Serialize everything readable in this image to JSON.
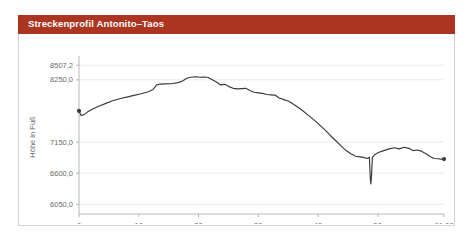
{
  "title": "Streckenprofil Antonito–Taos",
  "colors": {
    "banner": "#ab3520",
    "banner_text": "#ffffff",
    "line": "#3a3a3a",
    "grid": "#e4e4e4",
    "axis": "#b0b0b0",
    "tick_text": "#6b6b6b",
    "card": "#ffffff"
  },
  "chart_data": {
    "type": "line",
    "title": "Streckenprofil Antonito–Taos",
    "xlabel": "Entfernung in Meilen",
    "ylabel": "Höhe in Fuß",
    "xlim": [
      0,
      61.08
    ],
    "ylim": [
      5880,
      8600
    ],
    "grid": true,
    "legend": false,
    "xticks": [
      0,
      10,
      20,
      30,
      40,
      50,
      61.08
    ],
    "xticklabels": [
      "0",
      "10",
      "20",
      "30",
      "40",
      "50",
      "61,08"
    ],
    "yticks": [
      6050.0,
      6600.0,
      7150.0,
      8250.0,
      8507.2
    ],
    "yticklabels": [
      "6050,0",
      "6600,0",
      "7150,0",
      "8250,0",
      "8507,2"
    ],
    "series": [
      {
        "name": "Höhenprofil",
        "x": [
          0.0,
          0.35,
          0.8,
          1.4,
          2.2,
          3.2,
          4.4,
          5.6,
          6.8,
          8.0,
          9.2,
          10.4,
          11.6,
          12.4,
          13.0,
          13.6,
          14.4,
          15.4,
          16.6,
          17.4,
          17.9,
          18.4,
          19.0,
          19.6,
          20.2,
          20.9,
          21.6,
          22.3,
          23.0,
          23.7,
          24.4,
          25.1,
          25.8,
          26.5,
          27.2,
          27.9,
          28.6,
          29.3,
          30.0,
          30.7,
          31.4,
          32.1,
          32.8,
          33.5,
          34.3,
          35.1,
          35.9,
          36.7,
          37.5,
          38.3,
          39.1,
          39.9,
          40.7,
          41.5,
          42.3,
          43.1,
          43.9,
          44.7,
          45.5,
          46.3,
          47.0,
          47.6,
          48.2,
          48.6,
          48.75,
          48.85,
          48.95,
          49.1,
          49.5,
          50.2,
          51.0,
          51.9,
          52.8,
          53.6,
          54.4,
          55.2,
          55.9,
          56.6,
          57.3,
          58.0,
          58.7,
          59.4,
          60.1,
          60.6,
          61.08
        ],
        "y": [
          7700,
          7620,
          7630,
          7680,
          7730,
          7780,
          7830,
          7880,
          7915,
          7945,
          7975,
          8005,
          8040,
          8080,
          8160,
          8175,
          8178,
          8180,
          8200,
          8235,
          8270,
          8290,
          8300,
          8305,
          8295,
          8300,
          8290,
          8250,
          8210,
          8160,
          8170,
          8130,
          8100,
          8090,
          8095,
          8100,
          8060,
          8030,
          8020,
          8010,
          7990,
          7985,
          7980,
          7930,
          7900,
          7870,
          7820,
          7760,
          7700,
          7630,
          7560,
          7490,
          7410,
          7330,
          7240,
          7160,
          7080,
          7000,
          6945,
          6900,
          6890,
          6880,
          6860,
          6880,
          6500,
          6410,
          6560,
          6880,
          6930,
          6970,
          7000,
          7030,
          7050,
          7030,
          7060,
          7040,
          7000,
          7010,
          6990,
          6950,
          6900,
          6860,
          6855,
          6850,
          6850
        ]
      }
    ]
  }
}
